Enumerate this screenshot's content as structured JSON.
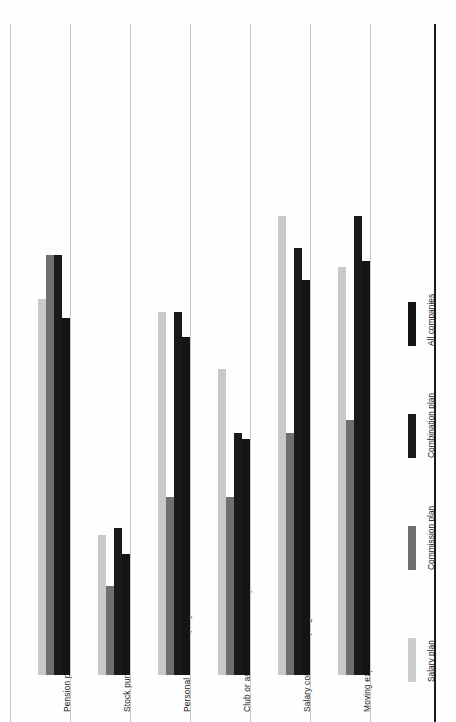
{
  "chart_data": {
    "type": "bar",
    "orientation": "vertical",
    "title": "",
    "xlabel": "",
    "ylabel": "",
    "grid": false,
    "legend_position": "right",
    "ylim": [
      0,
      100
    ],
    "categories": [
      "Pension plan",
      "Stock purchase",
      "Personal use of company car",
      "Club or association membership",
      "Salary continuation program",
      "Moving expense reimbursement"
    ],
    "series": [
      {
        "name": "Salary plan",
        "color": "#c9c9c9",
        "values": [
          59,
          22,
          57,
          48,
          72,
          64
        ]
      },
      {
        "name": "Commission plan",
        "color": "#6f6f6f",
        "values": [
          66,
          14,
          28,
          28,
          38,
          40
        ]
      },
      {
        "name": "Combination plan",
        "color": "#1a1a1a",
        "values": [
          66,
          23,
          57,
          38,
          67,
          72
        ]
      },
      {
        "name": "All companies",
        "color": "#141414",
        "values": [
          56,
          19,
          53,
          37,
          62,
          65
        ]
      }
    ]
  },
  "legend": {
    "items": [
      {
        "label": "Salary plan",
        "swatch": "salary"
      },
      {
        "label": "Commission plan",
        "swatch": "commission"
      },
      {
        "label": "Combination plan",
        "swatch": "combination"
      },
      {
        "label": "All companies",
        "swatch": "allco"
      }
    ]
  },
  "axis": {
    "baseline_color": "#1a1a1a",
    "separator_color": "#c9c9c9"
  }
}
